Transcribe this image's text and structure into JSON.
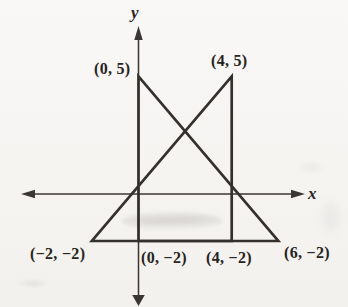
{
  "figure": {
    "type": "coordinate-plane-geometry",
    "background_color": "#f5f4f1",
    "line_color": "#34312d",
    "axis_color": "#3a3733",
    "text_color": "#262320",
    "axes": {
      "x_label": "x",
      "y_label": "y"
    },
    "points": [
      {
        "label": "(0, 5)",
        "x": 0,
        "y": 5
      },
      {
        "label": "(4, 5)",
        "x": 4,
        "y": 5
      },
      {
        "label": "(−2, −2)",
        "x": -2,
        "y": -2
      },
      {
        "label": "(0, −2)",
        "x": 0,
        "y": -2
      },
      {
        "label": "(4, −2)",
        "x": 4,
        "y": -2
      },
      {
        "label": "(6, −2)",
        "x": 6,
        "y": -2
      }
    ],
    "shapes": [
      {
        "name": "triangle-apex-0-5",
        "vertices": [
          [
            0,
            5
          ],
          [
            0,
            -2
          ],
          [
            6,
            -2
          ]
        ]
      },
      {
        "name": "triangle-apex-4-5",
        "vertices": [
          [
            4,
            5
          ],
          [
            4,
            -2
          ],
          [
            -2,
            -2
          ]
        ]
      }
    ]
  }
}
